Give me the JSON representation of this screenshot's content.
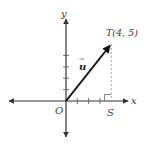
{
  "diagram": {
    "type": "coordinate-plane-vector",
    "axes": {
      "x_label": "x",
      "y_label": "y",
      "origin_label": "O",
      "x_ticks": [
        1,
        2,
        3,
        4
      ],
      "y_ticks": [
        1,
        2,
        3,
        4,
        5
      ]
    },
    "vector": {
      "label": "u",
      "arrow_mark": "→",
      "from": [
        0,
        0
      ],
      "to": [
        4,
        5
      ]
    },
    "points": [
      {
        "name": "T",
        "label": "T(4, 5)",
        "coords": [
          4,
          5
        ]
      },
      {
        "name": "S",
        "label": "S",
        "coords": [
          4,
          0
        ]
      }
    ],
    "annotations": {
      "dashed_segment": "T to S",
      "right_angle_at": "S"
    },
    "colors": {
      "axis": "#333333",
      "vector": "#111111",
      "dashed": "#888888",
      "text": "#3a3a3a"
    }
  }
}
